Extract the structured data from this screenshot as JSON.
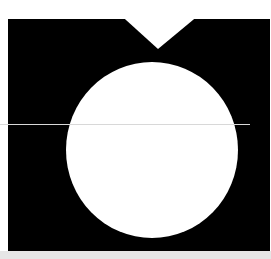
{
  "graphic": {
    "description": "Black rectangle with white triangular notch at top and white circle in center",
    "colors": {
      "background": "#ffffff",
      "panel": "#000000",
      "circle": "#ffffff",
      "divider": "#d8d8d8",
      "bottom_bar": "#e6e6e6"
    }
  }
}
